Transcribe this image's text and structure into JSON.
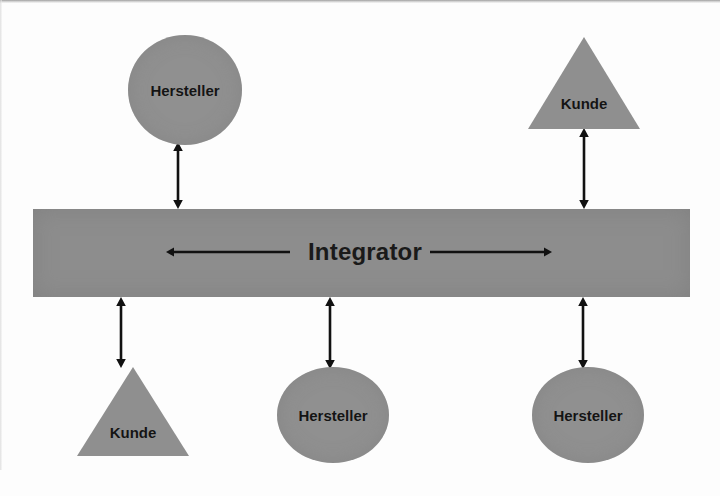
{
  "diagram": {
    "title": "Integrator",
    "hub": {
      "label": "Integrator",
      "fill_color": "#8d8d8d",
      "text_color": "#1a1a1a",
      "x": 33,
      "y": 209,
      "width": 657,
      "height": 88,
      "label_cx": 365,
      "label_cy": 252,
      "label_font_size": 24
    },
    "hub_arrows": [
      {
        "name": "integrator-arrow-left",
        "direction": "left",
        "x1": 290,
        "x2": 166,
        "y": 252
      },
      {
        "name": "integrator-arrow-right",
        "direction": "right",
        "x1": 430,
        "x2": 552,
        "y": 252
      }
    ],
    "nodes": [
      {
        "id": "hersteller-top-left",
        "label": "Hersteller",
        "shape": "circle",
        "position": "above",
        "x": 128,
        "y": 35,
        "width": 114,
        "height": 110,
        "label_cy": 55,
        "font_size": 15,
        "fill_color": "#909090"
      },
      {
        "id": "kunde-top-right",
        "label": "Kunde",
        "shape": "triangle",
        "position": "above",
        "x": 528,
        "y": 37,
        "width": 112,
        "height": 92,
        "label_cy": 66,
        "font_size": 15,
        "fill_color": "#8f8f8f"
      },
      {
        "id": "kunde-bottom-left",
        "label": "Kunde",
        "shape": "triangle",
        "position": "below",
        "x": 77,
        "y": 367,
        "width": 112,
        "height": 89,
        "label_cy": 65,
        "font_size": 15,
        "fill_color": "#8f8f8f"
      },
      {
        "id": "hersteller-bottom-middle",
        "label": "Hersteller",
        "shape": "circle",
        "position": "below",
        "x": 277,
        "y": 367,
        "width": 112,
        "height": 96,
        "label_cy": 48,
        "font_size": 15,
        "fill_color": "#909090"
      },
      {
        "id": "hersteller-bottom-right",
        "label": "Hersteller",
        "shape": "circle",
        "position": "below",
        "x": 532,
        "y": 367,
        "width": 112,
        "height": 96,
        "label_cy": 48,
        "font_size": 15,
        "fill_color": "#909090"
      }
    ],
    "connectors": [
      {
        "id": "connector-hersteller-top-left",
        "from": "hersteller-top-left",
        "to": "hub",
        "style": "double-headed",
        "x": 178,
        "y1": 142,
        "y2": 209
      },
      {
        "id": "connector-kunde-top-right",
        "from": "kunde-top-right",
        "to": "hub",
        "style": "double-headed",
        "x": 584,
        "y1": 128,
        "y2": 209
      },
      {
        "id": "connector-kunde-bottom-left",
        "from": "hub",
        "to": "kunde-bottom-left",
        "style": "double-headed",
        "x": 121,
        "y1": 297,
        "y2": 368
      },
      {
        "id": "connector-hersteller-bottom-middle",
        "from": "hub",
        "to": "hersteller-bottom-middle",
        "style": "double-headed",
        "x": 330,
        "y1": 297,
        "y2": 369
      },
      {
        "id": "connector-hersteller-bottom-right",
        "from": "hub",
        "to": "hersteller-bottom-right",
        "style": "double-headed",
        "x": 583,
        "y1": 297,
        "y2": 369
      }
    ]
  }
}
